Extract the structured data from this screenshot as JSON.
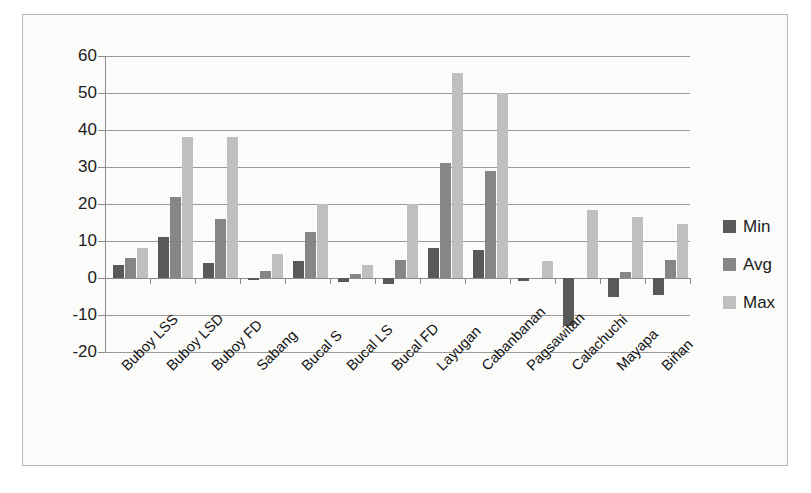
{
  "chart_data": {
    "type": "bar",
    "title": "",
    "xlabel": "",
    "ylabel": "",
    "ylim": [
      -20,
      60
    ],
    "ytick_step": 10,
    "ytick_labels": [
      "60",
      "50",
      "40",
      "30",
      "20",
      "10",
      "0",
      "-10",
      "-20"
    ],
    "ytick_values": [
      60,
      50,
      40,
      30,
      20,
      10,
      0,
      -10,
      -20
    ],
    "grid": true,
    "legend_position": "right",
    "categories": [
      "Buboy LSS",
      "Buboy LSD",
      "Buboy FD",
      "Sabang",
      "Bucal S",
      "Bucal LS",
      "Bucal FD",
      "Layugan",
      "Cabanbanan",
      "Pagsawitan",
      "Calachuchi",
      "Mayapa",
      "Biñan"
    ],
    "series": [
      {
        "name": "Min",
        "color": "#595959",
        "values": [
          3.5,
          11.0,
          4.0,
          -0.5,
          4.5,
          -1.0,
          -1.5,
          8.0,
          7.5,
          -0.8,
          -13.0,
          -5.0,
          -4.5
        ]
      },
      {
        "name": "Avg",
        "color": "#868686",
        "values": [
          5.5,
          22.0,
          16.0,
          2.0,
          12.5,
          1.0,
          5.0,
          31.0,
          29.0,
          0.0,
          0.0,
          1.5,
          5.0
        ]
      },
      {
        "name": "Max",
        "color": "#bfbfbf",
        "values": [
          8.0,
          38.0,
          38.0,
          6.5,
          20.0,
          3.5,
          20.0,
          55.5,
          50.0,
          4.5,
          18.5,
          16.5,
          14.5
        ]
      }
    ]
  },
  "legend": {
    "items": [
      {
        "label": "Min",
        "color": "#595959"
      },
      {
        "label": "Avg",
        "color": "#868686"
      },
      {
        "label": "Max",
        "color": "#bfbfbf"
      }
    ]
  }
}
